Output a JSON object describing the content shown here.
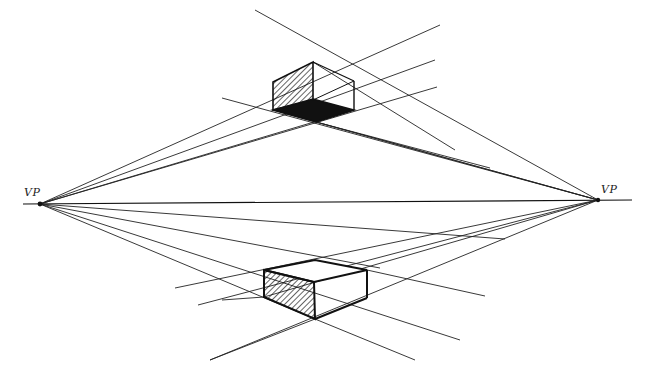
{
  "labels": {
    "left_vp": "VP",
    "right_vp": "VP"
  },
  "colors": {
    "ink": "#111111",
    "background": "#ffffff"
  },
  "geometry": {
    "left_vp": [
      40,
      204
    ],
    "right_vp": [
      598,
      200
    ],
    "horizon": [
      [
        23,
        204
      ],
      [
        632,
        200
      ]
    ],
    "top_box": {
      "hatched_face": [
        [
          273,
          82
        ],
        [
          313,
          62
        ],
        [
          313,
          100
        ],
        [
          273,
          110
        ]
      ],
      "bottom_face": [
        [
          273,
          110
        ],
        [
          313,
          99
        ],
        [
          354,
          110
        ],
        [
          316,
          122
        ]
      ],
      "right_edge": [
        [
          354,
          81
        ],
        [
          354,
          110
        ]
      ]
    },
    "bottom_box": {
      "top_face": [
        [
          264,
          270
        ],
        [
          315,
          260
        ],
        [
          367,
          270
        ],
        [
          314,
          282
        ]
      ],
      "hatched_face": [
        [
          264,
          270
        ],
        [
          314,
          282
        ],
        [
          315,
          319
        ],
        [
          264,
          297
        ]
      ],
      "right_edge": [
        [
          367,
          270
        ],
        [
          367,
          298
        ]
      ],
      "bottom_edge": [
        [
          315,
          319
        ],
        [
          367,
          298
        ]
      ]
    }
  }
}
